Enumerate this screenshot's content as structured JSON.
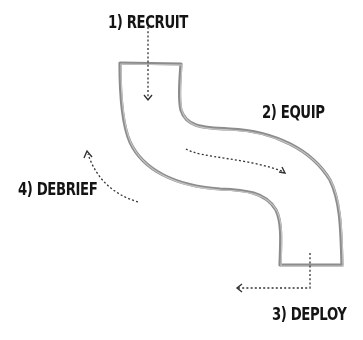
{
  "diagram": {
    "type": "process-cycle",
    "shape": "s-shaped pipe",
    "steps": [
      {
        "number": 1,
        "label": "1) RECRUIT",
        "arrow": "down into pipe top"
      },
      {
        "number": 2,
        "label": "2) EQUIP",
        "arrow": "through pipe middle, left to right"
      },
      {
        "number": 3,
        "label": "3) DEPLOY",
        "arrow": "down out of pipe bottom, then left"
      },
      {
        "number": 4,
        "label": "4) DEBRIEF",
        "arrow": "curving up-left, back toward start"
      }
    ],
    "colors": {
      "background": "#ffffff",
      "pipe_outline": "#8a8a8a",
      "arrow": "#333333",
      "text": "#141414"
    }
  }
}
